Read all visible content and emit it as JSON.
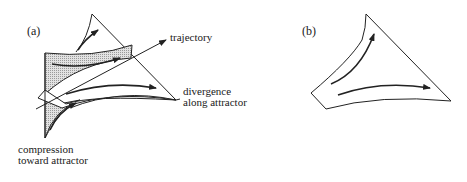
{
  "figure": {
    "panels": [
      {
        "id": "a",
        "label": "(a)",
        "annotations": {
          "trajectory": "trajectory",
          "divergence_line1": "divergence",
          "divergence_line2": "along attractor",
          "compression_line1": "compression",
          "compression_line2": "toward attractor"
        }
      },
      {
        "id": "b",
        "label": "(b)"
      }
    ],
    "colors": {
      "stroke": "#222222",
      "shading": "#d4d4d4",
      "background": "#ffffff"
    }
  }
}
